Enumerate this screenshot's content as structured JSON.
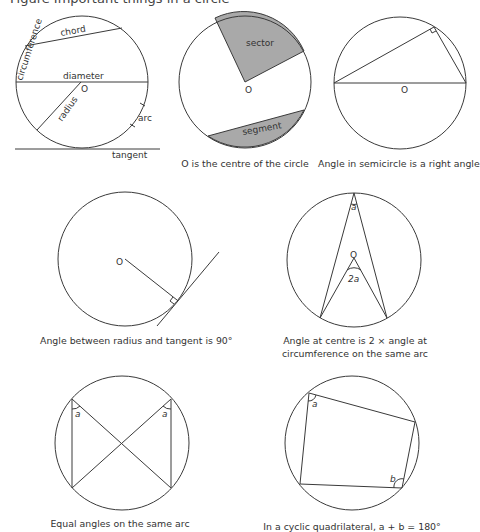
{
  "header": {
    "title_partial": "Figure  Important things in a circle"
  },
  "diagrams": [
    {
      "id": "parts",
      "labels": {
        "chord": "chord",
        "circumference": "circumference",
        "diameter": "diameter",
        "centre": "O",
        "radius": "radius",
        "arc": "arc",
        "tangent": "tangent"
      },
      "caption": ""
    },
    {
      "id": "sector-segment",
      "labels": {
        "sector": "sector",
        "segment": "segment",
        "centre": "O"
      },
      "caption": "O is the centre of the circle"
    },
    {
      "id": "semicircle",
      "labels": {
        "centre": "O"
      },
      "caption": "Angle in semicircle is a right angle"
    },
    {
      "id": "radius-tangent",
      "labels": {
        "centre": "O"
      },
      "caption": "Angle between radius and tangent is 90°"
    },
    {
      "id": "centre-angle",
      "labels": {
        "angle_a": "a",
        "angle_2a": "2a",
        "centre": "O"
      },
      "caption_line1": "Angle at centre is 2 × angle at",
      "caption_line2": "circumference on the same arc"
    },
    {
      "id": "same-arc",
      "labels": {
        "angle_left": "a",
        "angle_right": "a"
      },
      "caption": "Equal angles on the same arc"
    },
    {
      "id": "cyclic-quad",
      "labels": {
        "angle_a": "a",
        "angle_b": "b"
      },
      "caption": "In a cyclic quadrilateral, a + b = 180°"
    }
  ]
}
